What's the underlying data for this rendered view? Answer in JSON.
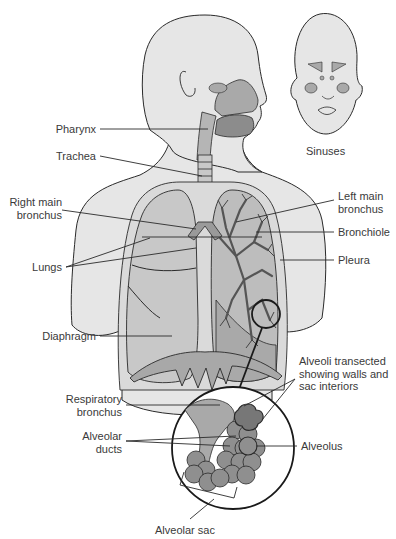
{
  "diagram": {
    "type": "anatomical-illustration",
    "colors": {
      "skin": "#e6e6e6",
      "lung": "#c8c8c8",
      "lung_dark": "#a9a9a9",
      "airway": "#9a9a9a",
      "alveoli": "#8f8f8f",
      "outline": "#2a2a2a",
      "text": "#3a3a3a"
    },
    "labels": {
      "pharynx": "Pharynx",
      "trachea": "Trachea",
      "sinuses": "Sinuses",
      "right_main_bronchus_l1": "Right main",
      "right_main_bronchus_l2": "bronchus",
      "left_main_bronchus_l1": "Left main",
      "left_main_bronchus_l2": "bronchus",
      "bronchiole": "Bronchiole",
      "lungs": "Lungs",
      "pleura": "Pleura",
      "diaphragm": "Diaphragm",
      "alveoli_transected_l1": "Alveoli transected",
      "alveoli_transected_l2": "showing walls and",
      "alveoli_transected_l3": "sac interiors",
      "respiratory_bronchus_l1": "Respiratory",
      "respiratory_bronchus_l2": "bronchus",
      "alveolar_ducts_l1": "Alveolar",
      "alveolar_ducts_l2": "ducts",
      "alveolus": "Alveolus",
      "alveolar_sac": "Alveolar sac"
    }
  }
}
